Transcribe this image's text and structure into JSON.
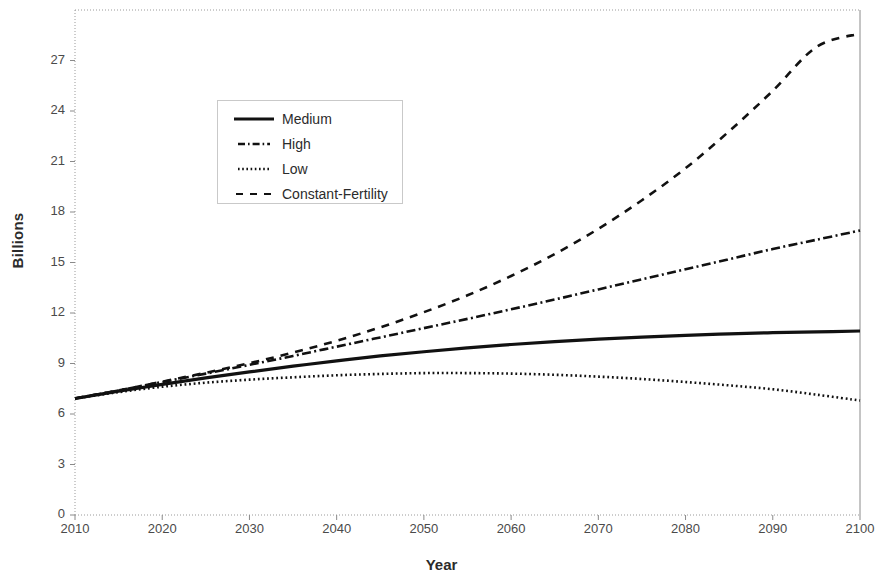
{
  "chart_data": {
    "type": "line",
    "title": "",
    "xlabel": "Year",
    "ylabel": "Billions",
    "xlim": [
      2010,
      2100
    ],
    "ylim": [
      0,
      30
    ],
    "grid": false,
    "legend_position": "upper-left-inside",
    "x_ticks": [
      "2010",
      "2020",
      "2030",
      "2040",
      "2050",
      "2060",
      "2070",
      "2080",
      "2090",
      "2100"
    ],
    "y_ticks": [
      "0",
      "3",
      "6",
      "9",
      "12",
      "15",
      "18",
      "21",
      "24",
      "27"
    ],
    "x": [
      2010,
      2015,
      2020,
      2025,
      2030,
      2035,
      2040,
      2045,
      2050,
      2055,
      2060,
      2065,
      2070,
      2075,
      2080,
      2085,
      2090,
      2095,
      2100
    ],
    "series": [
      {
        "name": "Medium",
        "style": "solid",
        "color": "#111111",
        "values": [
          6.92,
          7.35,
          7.76,
          8.15,
          8.5,
          8.84,
          9.16,
          9.45,
          9.7,
          9.93,
          10.13,
          10.3,
          10.45,
          10.57,
          10.67,
          10.76,
          10.83,
          10.88,
          10.93
        ]
      },
      {
        "name": "High",
        "style": "dashdot",
        "color": "#111111",
        "values": [
          6.92,
          7.4,
          7.9,
          8.4,
          8.92,
          9.45,
          10.0,
          10.55,
          11.1,
          11.65,
          12.22,
          12.8,
          13.4,
          14.0,
          14.6,
          15.2,
          15.8,
          16.35,
          16.9
        ]
      },
      {
        "name": "Low",
        "style": "dotted",
        "color": "#111111",
        "values": [
          6.92,
          7.3,
          7.62,
          7.86,
          8.04,
          8.18,
          8.3,
          8.38,
          8.43,
          8.43,
          8.4,
          8.33,
          8.22,
          8.08,
          7.9,
          7.7,
          7.47,
          7.15,
          6.8
        ]
      },
      {
        "name": "Constant-Fertility",
        "style": "dashed",
        "color": "#111111",
        "values": [
          6.92,
          7.4,
          7.92,
          8.45,
          9.02,
          9.65,
          10.35,
          11.15,
          12.05,
          13.05,
          14.2,
          15.5,
          17.0,
          18.7,
          20.6,
          22.8,
          25.2,
          27.8,
          28.6
        ]
      }
    ]
  },
  "legend": {
    "items": [
      {
        "label": "Medium"
      },
      {
        "label": "High"
      },
      {
        "label": "Low"
      },
      {
        "label": "Constant-Fertility"
      }
    ]
  }
}
